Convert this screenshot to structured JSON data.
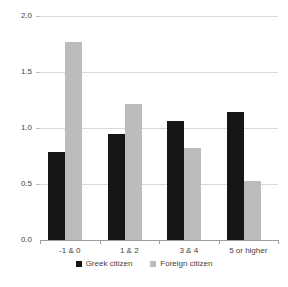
{
  "chart_data": {
    "type": "bar",
    "title": "",
    "xlabel": "",
    "ylabel": "",
    "categories": [
      "-1 & 0",
      "1 & 2",
      "3 & 4",
      "5 or higher"
    ],
    "series": [
      {
        "name": "Greek citizen",
        "color": "#161616",
        "values": [
          0.79,
          0.95,
          1.06,
          1.14
        ]
      },
      {
        "name": "Foreign citizen",
        "color": "#bcbcbc",
        "values": [
          1.77,
          1.21,
          0.82,
          0.53
        ]
      }
    ],
    "ylim": [
      0.0,
      2.0
    ],
    "ytick_step": 0.5,
    "ytick_labels": [
      "0.0",
      "0.5",
      "1.0",
      "1.5",
      "2.0"
    ],
    "grid": "horizontal",
    "legend_position": "bottom"
  },
  "colors": {
    "background": "#ffffff",
    "gridline": "#d9d9d9",
    "axis": "#9d9d9d",
    "text": "#3f3f3f"
  }
}
